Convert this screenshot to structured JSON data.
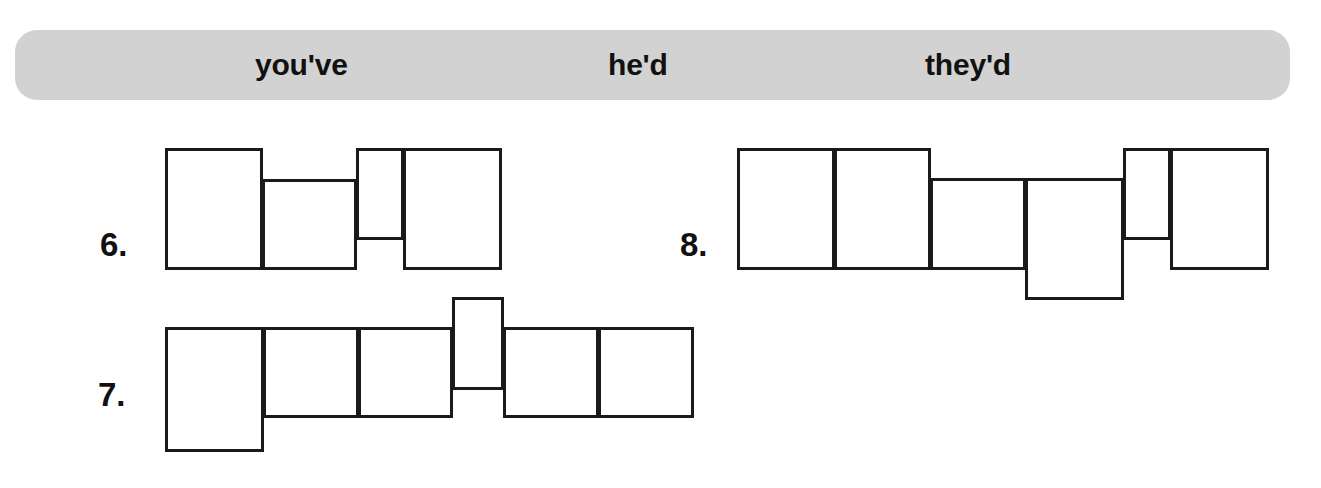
{
  "word_bank": {
    "name": "word-bank",
    "background_color": "#d2d2d2",
    "words": [
      {
        "text": "you've",
        "x": 255
      },
      {
        "text": "he'd",
        "x": 608
      },
      {
        "text": "they'd",
        "x": 925
      }
    ]
  },
  "items": [
    {
      "number": "6.",
      "number_x": 100,
      "number_y": 228,
      "answer_letters": 4,
      "boxes": [
        {
          "x": 165,
          "y": 148,
          "w": 98,
          "h": 122,
          "type": "tall"
        },
        {
          "x": 262,
          "y": 179,
          "w": 95,
          "h": 91,
          "type": "short"
        },
        {
          "x": 356,
          "y": 148,
          "w": 48,
          "h": 92,
          "type": "tall-narrow"
        },
        {
          "x": 403,
          "y": 148,
          "w": 99,
          "h": 122,
          "type": "tall"
        }
      ]
    },
    {
      "number": "7.",
      "number_x": 98,
      "number_y": 378,
      "answer_letters": 6,
      "boxes": [
        {
          "x": 165,
          "y": 327,
          "w": 99,
          "h": 125,
          "type": "descender"
        },
        {
          "x": 263,
          "y": 327,
          "w": 96,
          "h": 91,
          "type": "short"
        },
        {
          "x": 358,
          "y": 327,
          "w": 95,
          "h": 91,
          "type": "short"
        },
        {
          "x": 452,
          "y": 297,
          "w": 52,
          "h": 93,
          "type": "tall-narrow"
        },
        {
          "x": 503,
          "y": 327,
          "w": 96,
          "h": 91,
          "type": "short"
        },
        {
          "x": 598,
          "y": 327,
          "w": 96,
          "h": 91,
          "type": "short"
        }
      ]
    },
    {
      "number": "8.",
      "number_x": 680,
      "number_y": 228,
      "answer_letters": 6,
      "boxes": [
        {
          "x": 737,
          "y": 148,
          "w": 98,
          "h": 122,
          "type": "tall"
        },
        {
          "x": 834,
          "y": 148,
          "w": 97,
          "h": 122,
          "type": "tall"
        },
        {
          "x": 930,
          "y": 178,
          "w": 96,
          "h": 92,
          "type": "short"
        },
        {
          "x": 1025,
          "y": 178,
          "w": 99,
          "h": 122,
          "type": "descender"
        },
        {
          "x": 1123,
          "y": 148,
          "w": 48,
          "h": 92,
          "type": "tall-narrow"
        },
        {
          "x": 1170,
          "y": 148,
          "w": 99,
          "h": 122,
          "type": "tall"
        }
      ]
    }
  ]
}
